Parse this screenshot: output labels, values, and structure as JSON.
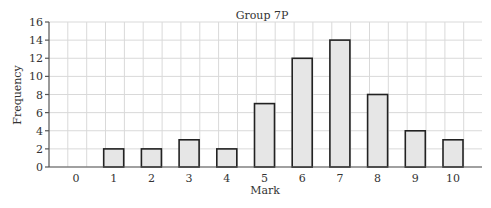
{
  "chart_data": {
    "type": "bar",
    "title": "Group 7P",
    "xlabel": "Mark",
    "ylabel": "Frequency",
    "categories": [
      "0",
      "1",
      "2",
      "3",
      "4",
      "5",
      "6",
      "7",
      "8",
      "9",
      "10"
    ],
    "values": [
      0,
      2,
      2,
      3,
      2,
      7,
      12,
      14,
      8,
      4,
      3
    ],
    "ylim": [
      0,
      16
    ],
    "yticks": [
      0,
      2,
      4,
      6,
      8,
      10,
      12,
      14,
      16
    ],
    "grid": true,
    "legend": null,
    "colors": {
      "bar_fill": "#e6e6e6",
      "bar_stroke": "#222222",
      "grid": "#d9d9d9",
      "axis": "#555555"
    }
  }
}
